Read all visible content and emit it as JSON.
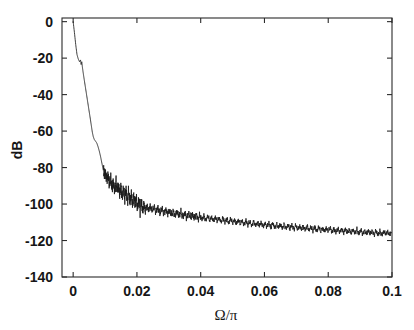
{
  "figure": {
    "background_color": "#ffffff",
    "line_color": "#1a1a1a",
    "axis_color": "#2b2b2b"
  },
  "chart_data": {
    "type": "line",
    "title": "",
    "subtitle": "",
    "xlabel": "Ω/π",
    "ylabel": "dB",
    "xlim": [
      -0.0035,
      0.1
    ],
    "ylim": [
      -140,
      2
    ],
    "xticks": [
      0,
      0.02,
      0.04,
      0.06,
      0.08,
      0.1
    ],
    "xtick_labels": [
      "0",
      "0.02",
      "0.04",
      "0.06",
      "0.08",
      "0.1"
    ],
    "yticks": [
      0,
      -20,
      -40,
      -60,
      -80,
      -100,
      -120,
      -140
    ],
    "ytick_labels": [
      "0",
      "-20",
      "-40",
      "-60",
      "-80",
      "-100",
      "-120",
      "-140"
    ],
    "grid": false,
    "legend": null,
    "legend_position": "none",
    "annotations": [],
    "series": [
      {
        "name": "magnitude response",
        "description": "Lowpass filter magnitude response in dB versus normalized frequency; passband at 0 dB, steep transition to about -70 dB by 0.006, then a rippling stopband noise floor decaying from about -95 dB to about -116 dB.",
        "x": [
          0.0,
          0.0004,
          0.0008,
          0.0012,
          0.0016,
          0.002,
          0.0023,
          0.0025,
          0.0027,
          0.0029,
          0.0031,
          0.0034,
          0.0038,
          0.0042,
          0.0046,
          0.005,
          0.0054,
          0.0057,
          0.006,
          0.0063,
          0.0066,
          0.007,
          0.0074,
          0.0078,
          0.0082,
          0.0086,
          0.009,
          0.0094,
          0.0098,
          0.0102,
          0.0106,
          0.011,
          0.0114,
          0.0118,
          0.0122,
          0.0126,
          0.013,
          0.0134,
          0.0138,
          0.0142,
          0.0146,
          0.015,
          0.0154,
          0.0158,
          0.0162,
          0.0166,
          0.017,
          0.0174,
          0.0178,
          0.0182,
          0.0186,
          0.019,
          0.0194,
          0.0198,
          0.0202,
          0.0206,
          0.021,
          0.0214,
          0.0218,
          0.0222,
          0.0226,
          0.023,
          0.0236,
          0.0242,
          0.0248,
          0.0254,
          0.026,
          0.0266,
          0.0272,
          0.0278,
          0.0284,
          0.029,
          0.0296,
          0.0302,
          0.0308,
          0.0314,
          0.032,
          0.0326,
          0.0332,
          0.0338,
          0.0344,
          0.035,
          0.0356,
          0.0362,
          0.0368,
          0.0374,
          0.038,
          0.0386,
          0.0392,
          0.0398,
          0.0404,
          0.041,
          0.0416,
          0.0422,
          0.0428,
          0.0434,
          0.044,
          0.0446,
          0.0452,
          0.0458,
          0.0464,
          0.047,
          0.0476,
          0.0482,
          0.0488,
          0.0494,
          0.05,
          0.0506,
          0.0512,
          0.0518,
          0.0524,
          0.053,
          0.0536,
          0.0542,
          0.0548,
          0.0554,
          0.056,
          0.0566,
          0.0572,
          0.0578,
          0.0584,
          0.059,
          0.0596,
          0.0602,
          0.0608,
          0.0614,
          0.062,
          0.0626,
          0.0632,
          0.0638,
          0.0644,
          0.065,
          0.0656,
          0.0662,
          0.0668,
          0.0674,
          0.068,
          0.0686,
          0.0692,
          0.0698,
          0.0704,
          0.071,
          0.0716,
          0.0722,
          0.0728,
          0.0734,
          0.074,
          0.0746,
          0.0752,
          0.0758,
          0.0764,
          0.077,
          0.0776,
          0.0782,
          0.0788,
          0.0794,
          0.08,
          0.0806,
          0.0812,
          0.0818,
          0.0824,
          0.083,
          0.0836,
          0.0842,
          0.0848,
          0.0854,
          0.086,
          0.0866,
          0.0872,
          0.0878,
          0.0884,
          0.089,
          0.0896,
          0.0902,
          0.0908,
          0.0914,
          0.092,
          0.0926,
          0.0932,
          0.0938,
          0.0944,
          0.095,
          0.0956,
          0.0962,
          0.0968,
          0.0974,
          0.098,
          0.0986,
          0.0992,
          0.0998
        ],
        "y": [
          0.0,
          -6.0,
          -12.5,
          -18.0,
          -20.5,
          -22.0,
          -21.0,
          -23.5,
          -22.0,
          -25.0,
          -27.5,
          -31.0,
          -35.5,
          -40.0,
          -44.5,
          -49.0,
          -53.5,
          -57.0,
          -60.5,
          -63.0,
          -64.5,
          -65.5,
          -66.5,
          -68.5,
          -71.0,
          -74.0,
          -77.5,
          -81.0,
          -84.0,
          -83.0,
          -86.5,
          -84.5,
          -89.5,
          -86.0,
          -91.0,
          -88.0,
          -93.0,
          -87.5,
          -92.5,
          -89.5,
          -95.0,
          -90.0,
          -96.5,
          -91.5,
          -97.0,
          -92.0,
          -98.5,
          -93.0,
          -99.5,
          -94.0,
          -100.5,
          -95.0,
          -101.0,
          -96.5,
          -102.5,
          -97.5,
          -103.5,
          -98.5,
          -104.0,
          -99.5,
          -104.5,
          -100.5,
          -103.5,
          -101.0,
          -104.0,
          -101.5,
          -104.5,
          -102.0,
          -105.0,
          -102.5,
          -105.0,
          -103.0,
          -105.5,
          -103.5,
          -106.0,
          -104.0,
          -106.5,
          -104.0,
          -106.5,
          -104.5,
          -107.0,
          -105.0,
          -107.5,
          -105.0,
          -107.5,
          -105.5,
          -108.0,
          -105.5,
          -108.5,
          -106.0,
          -108.5,
          -106.5,
          -109.0,
          -106.5,
          -109.0,
          -107.0,
          -109.5,
          -107.0,
          -109.5,
          -107.5,
          -110.0,
          -107.5,
          -110.0,
          -108.0,
          -110.5,
          -108.0,
          -110.5,
          -108.5,
          -111.0,
          -108.5,
          -111.0,
          -109.0,
          -111.5,
          -109.0,
          -111.5,
          -109.5,
          -112.0,
          -109.5,
          -112.0,
          -110.0,
          -112.0,
          -110.0,
          -112.5,
          -110.5,
          -112.5,
          -110.5,
          -113.0,
          -110.5,
          -113.0,
          -111.0,
          -113.0,
          -111.0,
          -113.5,
          -111.0,
          -113.5,
          -111.5,
          -113.5,
          -111.5,
          -114.0,
          -111.5,
          -114.0,
          -112.0,
          -114.0,
          -112.0,
          -114.5,
          -112.0,
          -114.5,
          -112.5,
          -114.5,
          -112.5,
          -115.0,
          -112.5,
          -115.0,
          -113.0,
          -115.0,
          -113.0,
          -115.0,
          -113.0,
          -115.5,
          -113.5,
          -115.5,
          -113.5,
          -115.5,
          -113.5,
          -116.0,
          -113.5,
          -116.0,
          -114.0,
          -116.0,
          -114.0,
          -116.0,
          -114.0,
          -116.5,
          -114.0,
          -116.5,
          -114.5,
          -116.5,
          -114.5,
          -116.5,
          -114.5,
          -117.0,
          -114.5,
          -117.0,
          -115.0,
          -117.0,
          -115.0,
          -116.5,
          -115.0,
          -117.0,
          -115.5
        ]
      }
    ]
  }
}
